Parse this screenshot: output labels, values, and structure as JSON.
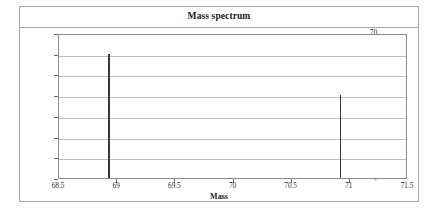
{
  "chart_data": {
    "type": "bar",
    "title": "Mass spectrum",
    "xlabel": "Mass",
    "ylabel": "% abundance",
    "xlim": [
      68.5,
      71.5
    ],
    "ylim": [
      0,
      70
    ],
    "xticks": [
      "68.5",
      "69",
      "69.5",
      "70",
      "70.5",
      "71",
      "71.5"
    ],
    "xtick_values": [
      68.5,
      69,
      69.5,
      70,
      70.5,
      71,
      71.5
    ],
    "yticks": [
      "0",
      "10",
      "20",
      "30",
      "40",
      "50",
      "60",
      "70"
    ],
    "ytick_values": [
      0,
      10,
      20,
      30,
      40,
      50,
      60,
      70
    ],
    "x": [
      68.93,
      70.92
    ],
    "values": [
      60,
      40
    ],
    "grid": "horizontal",
    "legend": "none",
    "bar_color": "#3a3a3a",
    "gridline_color": "#bdbdbd",
    "axis_color": "#8d8d8d",
    "background_color": "#ffffff"
  }
}
